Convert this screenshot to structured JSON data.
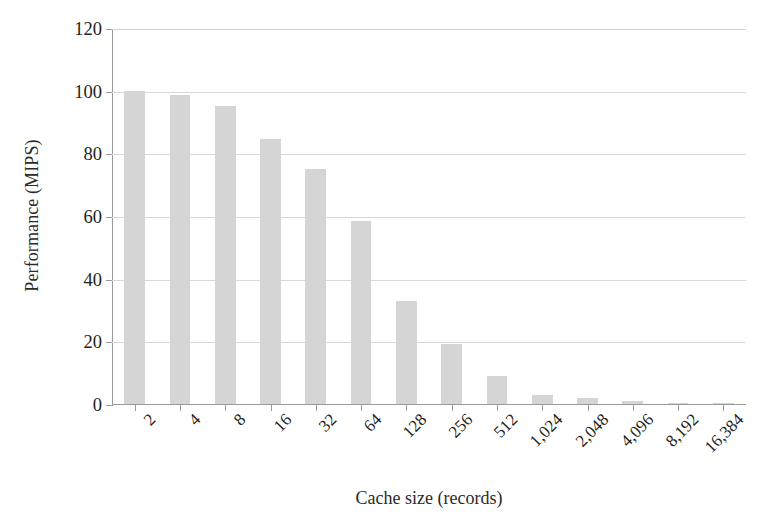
{
  "chart_data": {
    "type": "bar",
    "title": "",
    "subtitle": "",
    "xlabel": "Cache size (records)",
    "ylabel": "Performance (MIPS)",
    "categories": [
      "2",
      "4",
      "8",
      "16",
      "32",
      "64",
      "128",
      "256",
      "512",
      "1,024",
      "2,048",
      "4,096",
      "8,192",
      "16,384"
    ],
    "values": [
      100,
      98.5,
      95,
      84.5,
      75,
      58.5,
      33,
      19,
      9,
      3,
      2,
      1,
      0.3,
      0.2
    ],
    "series": [
      {
        "name": "Performance",
        "values": [
          100,
          98.5,
          95,
          84.5,
          75,
          58.5,
          33,
          19,
          9,
          3,
          2,
          1,
          0.3,
          0.2
        ]
      }
    ],
    "ylim": [
      0,
      120
    ],
    "yticks": [
      0,
      20,
      40,
      60,
      80,
      100,
      120
    ],
    "ytick_labels": [
      "0",
      "20",
      "40",
      "60",
      "80",
      "100",
      "120"
    ],
    "grid": true,
    "grid_axis": "y",
    "legend": false,
    "legend_position": "none",
    "bar_color": "#d5d5d5",
    "axis_color": "#9a9a9a",
    "grid_color": "#d9d9d9",
    "text_color": "#231f20",
    "background": "#ffffff",
    "xtick_label_rotation": -45
  }
}
